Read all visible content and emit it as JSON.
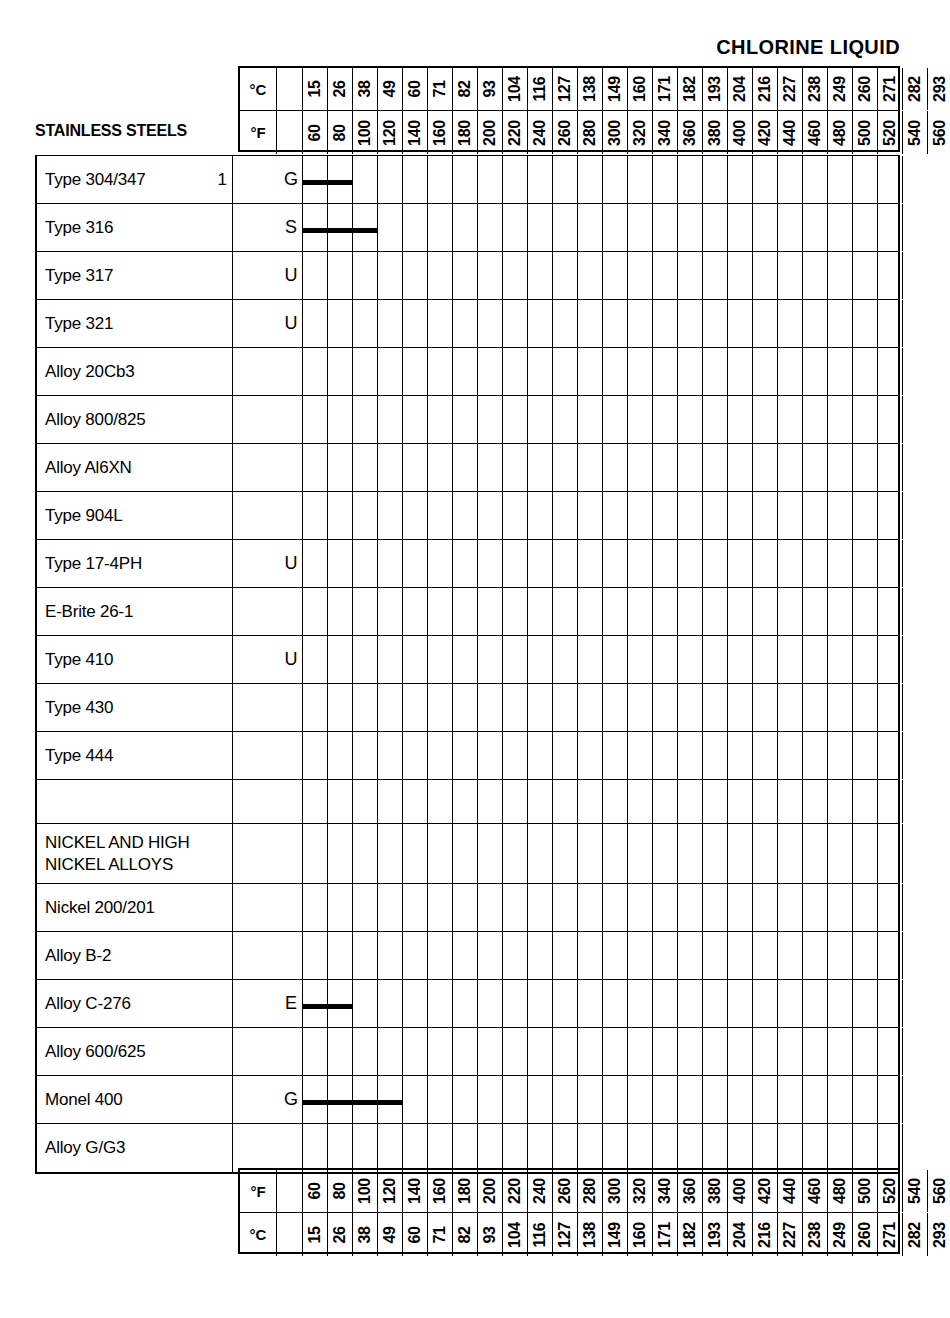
{
  "title": "CHLORINE LIQUID",
  "axis": {
    "celsius_unit": "°C",
    "fahrenheit_unit": "°F",
    "celsius_ticks": [
      15,
      26,
      38,
      49,
      60,
      71,
      82,
      93,
      104,
      116,
      127,
      138,
      149,
      160,
      171,
      182,
      193,
      204,
      216,
      227,
      238,
      249,
      260,
      271,
      282,
      293
    ],
    "fahrenheit_ticks": [
      60,
      80,
      100,
      120,
      140,
      160,
      180,
      200,
      220,
      240,
      260,
      280,
      300,
      320,
      340,
      360,
      380,
      400,
      420,
      440,
      460,
      480,
      500,
      520,
      540,
      560
    ]
  },
  "section_header": "STAINLESS STEELS",
  "rows": [
    {
      "label": "Type 304/347",
      "note": "1",
      "rating": "G",
      "bar_start_f": 60,
      "bar_end_f": 100
    },
    {
      "label": "Type 316",
      "note": "",
      "rating": "S",
      "bar_start_f": 60,
      "bar_end_f": 120
    },
    {
      "label": "Type 317",
      "note": "",
      "rating": "U",
      "bar_start_f": null,
      "bar_end_f": null
    },
    {
      "label": "Type 321",
      "note": "",
      "rating": "U",
      "bar_start_f": null,
      "bar_end_f": null
    },
    {
      "label": "Alloy 20Cb3",
      "note": "",
      "rating": "",
      "bar_start_f": null,
      "bar_end_f": null
    },
    {
      "label": "Alloy 800/825",
      "note": "",
      "rating": "",
      "bar_start_f": null,
      "bar_end_f": null
    },
    {
      "label": "Alloy Al6XN",
      "note": "",
      "rating": "",
      "bar_start_f": null,
      "bar_end_f": null
    },
    {
      "label": "Type 904L",
      "note": "",
      "rating": "",
      "bar_start_f": null,
      "bar_end_f": null
    },
    {
      "label": "Type 17-4PH",
      "note": "",
      "rating": "U",
      "bar_start_f": null,
      "bar_end_f": null
    },
    {
      "label": "E-Brite 26-1",
      "note": "",
      "rating": "",
      "bar_start_f": null,
      "bar_end_f": null
    },
    {
      "label": "Type 410",
      "note": "",
      "rating": "U",
      "bar_start_f": null,
      "bar_end_f": null
    },
    {
      "label": "Type 430",
      "note": "",
      "rating": "",
      "bar_start_f": null,
      "bar_end_f": null
    },
    {
      "label": "Type 444",
      "note": "",
      "rating": "",
      "bar_start_f": null,
      "bar_end_f": null
    },
    {
      "label": "",
      "note": "",
      "rating": "",
      "bar_start_f": null,
      "bar_end_f": null,
      "spacer": true
    },
    {
      "label": "NICKEL AND HIGH\nNICKEL ALLOYS",
      "note": "",
      "rating": "",
      "bar_start_f": null,
      "bar_end_f": null,
      "section": true,
      "tall": true
    },
    {
      "label": "Nickel 200/201",
      "note": "",
      "rating": "",
      "bar_start_f": null,
      "bar_end_f": null
    },
    {
      "label": "Alloy B-2",
      "note": "",
      "rating": "",
      "bar_start_f": null,
      "bar_end_f": null
    },
    {
      "label": "Alloy C-276",
      "note": "",
      "rating": "E",
      "bar_start_f": 60,
      "bar_end_f": 100
    },
    {
      "label": "Alloy 600/625",
      "note": "",
      "rating": "",
      "bar_start_f": null,
      "bar_end_f": null
    },
    {
      "label": "Monel 400",
      "note": "",
      "rating": "G",
      "bar_start_f": 60,
      "bar_end_f": 140
    },
    {
      "label": "Alloy G/G3",
      "note": "",
      "rating": "",
      "bar_start_f": null,
      "bar_end_f": null
    }
  ],
  "chart_data": {
    "type": "bar",
    "title": "CHLORINE LIQUID",
    "subtitle": "Corrosion resistance service-temperature ranges by alloy",
    "xlabel": "Temperature",
    "ylabel": "Alloy",
    "xlim_f": [
      60,
      560
    ],
    "xlim_c": [
      15,
      293
    ],
    "grid": true,
    "legend_position": "none",
    "x_tick_labels_f": [
      "60",
      "80",
      "100",
      "120",
      "140",
      "160",
      "180",
      "200",
      "220",
      "240",
      "260",
      "280",
      "300",
      "320",
      "340",
      "360",
      "380",
      "400",
      "420",
      "440",
      "460",
      "480",
      "500",
      "520",
      "540",
      "560"
    ],
    "x_tick_labels_c": [
      "15",
      "26",
      "38",
      "49",
      "60",
      "71",
      "82",
      "93",
      "104",
      "116",
      "127",
      "138",
      "149",
      "160",
      "171",
      "182",
      "193",
      "204",
      "216",
      "227",
      "238",
      "249",
      "260",
      "271",
      "282",
      "293"
    ],
    "rating_codes": [
      "G",
      "S",
      "U",
      "E"
    ],
    "categories": [
      "Type 304/347",
      "Type 316",
      "Type 317",
      "Type 321",
      "Alloy 20Cb3",
      "Alloy 800/825",
      "Alloy Al6XN",
      "Type 904L",
      "Type 17-4PH",
      "E-Brite 26-1",
      "Type 410",
      "Type 430",
      "Type 444",
      "NICKEL AND HIGH NICKEL ALLOYS",
      "Nickel 200/201",
      "Alloy B-2",
      "Alloy C-276",
      "Alloy 600/625",
      "Monel 400",
      "Alloy G/G3"
    ],
    "bars": [
      {
        "category": "Type 304/347",
        "rating": "G",
        "start_f": 60,
        "end_f": 100,
        "start_c": 15,
        "end_c": 38
      },
      {
        "category": "Type 316",
        "rating": "S",
        "start_f": 60,
        "end_f": 120,
        "start_c": 15,
        "end_c": 49
      },
      {
        "category": "Type 317",
        "rating": "U",
        "start_f": null,
        "end_f": null,
        "start_c": null,
        "end_c": null
      },
      {
        "category": "Type 321",
        "rating": "U",
        "start_f": null,
        "end_f": null,
        "start_c": null,
        "end_c": null
      },
      {
        "category": "Type 17-4PH",
        "rating": "U",
        "start_f": null,
        "end_f": null,
        "start_c": null,
        "end_c": null
      },
      {
        "category": "Type 410",
        "rating": "U",
        "start_f": null,
        "end_f": null,
        "start_c": null,
        "end_c": null
      },
      {
        "category": "Alloy C-276",
        "rating": "E",
        "start_f": 60,
        "end_f": 100,
        "start_c": 15,
        "end_c": 38
      },
      {
        "category": "Monel 400",
        "rating": "G",
        "start_f": 60,
        "end_f": 140,
        "start_c": 15,
        "end_c": 60
      }
    ],
    "footnotes": [
      {
        "marker": "1",
        "category": "Type 304/347"
      }
    ]
  }
}
